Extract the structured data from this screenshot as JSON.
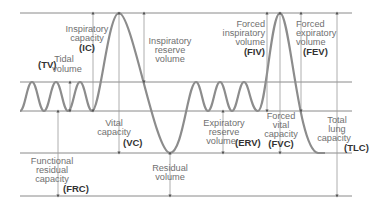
{
  "colors": {
    "curve": "#8c8c8c",
    "reference_lines": "#8a8a8a",
    "label_text": "#707070",
    "abbreviation_text": "#333333"
  },
  "levels": [
    "Total lung capacity (top)",
    "End of tidal inspiration",
    "End of tidal expiration (FRC level)",
    "Residual volume level",
    "Zero volume (bottom)"
  ],
  "labels": {
    "tv": {
      "abbr": "(TV)",
      "lines": [
        "Tidal",
        "volume"
      ]
    },
    "ic": {
      "abbr": "(IC)",
      "lines": [
        "Inspiratory",
        "capacity"
      ]
    },
    "irv": {
      "abbr": "",
      "lines": [
        "Inspiratory",
        "reserve",
        "volume"
      ]
    },
    "vc": {
      "abbr": "(VC)",
      "lines": [
        "Vital",
        "capacity"
      ]
    },
    "frc": {
      "abbr": "(FRC)",
      "lines": [
        "Functional",
        "residual",
        "capacity"
      ]
    },
    "rv": {
      "abbr": "",
      "lines": [
        "Residual",
        "volume"
      ]
    },
    "erv": {
      "abbr": "(ERV)",
      "lines": [
        "Expiratory",
        "reserve",
        "volume"
      ]
    },
    "fiv": {
      "abbr": "(FIV)",
      "lines": [
        "Forced",
        "inspiratory",
        "volume"
      ]
    },
    "fev": {
      "abbr": "(FEV)",
      "lines": [
        "Forced",
        "expiratory",
        "volume"
      ]
    },
    "fvc": {
      "abbr": "(FVC)",
      "lines": [
        "Forced",
        "vital",
        "capacity"
      ]
    },
    "tlc": {
      "abbr": "(TLC)",
      "lines": [
        "Total",
        "lung",
        "capacity"
      ]
    }
  }
}
